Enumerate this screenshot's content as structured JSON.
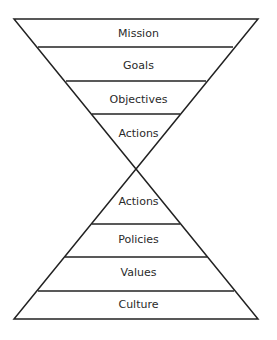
{
  "diagram": {
    "top_triangle": {
      "levels": [
        "Mission",
        "Goals",
        "Objectives",
        "Actions"
      ]
    },
    "bottom_triangle": {
      "levels": [
        "Actions",
        "Policies",
        "Values",
        "Culture"
      ]
    },
    "colors": {
      "line": "#222222",
      "background": "#ffffff",
      "text": "#2a2a2a"
    }
  }
}
